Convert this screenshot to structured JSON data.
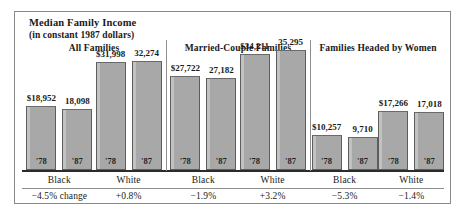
{
  "chart_data": {
    "type": "bar",
    "title": "Median Family Income",
    "subtitle": "(in constant 1987 dollars)",
    "xlabel": "",
    "ylabel": "",
    "grid": false,
    "legend_position": "none",
    "ylim": [
      0,
      36000
    ],
    "units": "constant 1987 dollars",
    "categories": [
      "'78",
      "'87"
    ],
    "panels": [
      {
        "heading": "All Families",
        "groups": [
          {
            "name": "Black",
            "change": "−4.5% change",
            "bars": [
              {
                "year": "'78",
                "value": 18952,
                "label": "$18,952"
              },
              {
                "year": "'87",
                "value": 18098,
                "label": "18,098"
              }
            ]
          },
          {
            "name": "White",
            "change": "+0.8%",
            "bars": [
              {
                "year": "'78",
                "value": 31998,
                "label": "$31,998"
              },
              {
                "year": "'87",
                "value": 32274,
                "label": "32,274"
              }
            ]
          }
        ]
      },
      {
        "heading": "Married-Couple Families",
        "groups": [
          {
            "name": "Black",
            "change": "−1.9%",
            "bars": [
              {
                "year": "'78",
                "value": 27722,
                "label": "$27,722"
              },
              {
                "year": "'87",
                "value": 27182,
                "label": "27,182"
              }
            ]
          },
          {
            "name": "White",
            "change": "+3.2%",
            "bars": [
              {
                "year": "'78",
                "value": 34211,
                "label": "$34,211"
              },
              {
                "year": "'87",
                "value": 35295,
                "label": "35,295"
              }
            ]
          }
        ]
      },
      {
        "heading": "Families Headed by Women",
        "groups": [
          {
            "name": "Black",
            "change": "−5.3%",
            "bars": [
              {
                "year": "'78",
                "value": 10257,
                "label": "$10,257"
              },
              {
                "year": "'87",
                "value": 9710,
                "label": "9,710"
              }
            ]
          },
          {
            "name": "White",
            "change": "−1.4%",
            "bars": [
              {
                "year": "'78",
                "value": 17266,
                "label": "$17,266"
              },
              {
                "year": "'87",
                "value": 17018,
                "label": "17,018"
              }
            ]
          }
        ]
      }
    ]
  },
  "colors": {
    "bar_fill": "#a8a8a8",
    "bar_edge": "#5d5d5d",
    "bar_highlight": "#c2c2c2",
    "axis": "#2b2b2b",
    "frame": "#8a8a8a",
    "text": "#1a1a1a",
    "background": "#ffffff"
  }
}
